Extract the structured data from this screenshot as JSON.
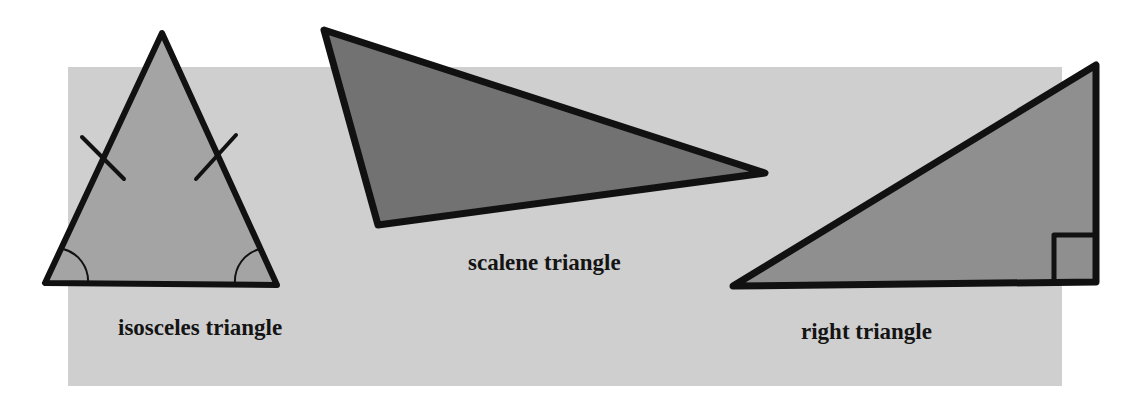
{
  "diagram": {
    "colors": {
      "page_background": "#ffffff",
      "panel_background": "#cfcfcf",
      "outline": "#111111",
      "isosceles_fill": "#a4a4a4",
      "scalene_fill": "#727272",
      "right_fill": "#8f8f8f"
    },
    "triangles": [
      {
        "id": "isosceles",
        "label": "isosceles triangle",
        "markers": [
          "two equal-side tick marks",
          "two equal base-angle arcs"
        ]
      },
      {
        "id": "scalene",
        "label": "scalene triangle",
        "markers": []
      },
      {
        "id": "right",
        "label": "right triangle",
        "markers": [
          "right-angle square"
        ]
      }
    ]
  }
}
